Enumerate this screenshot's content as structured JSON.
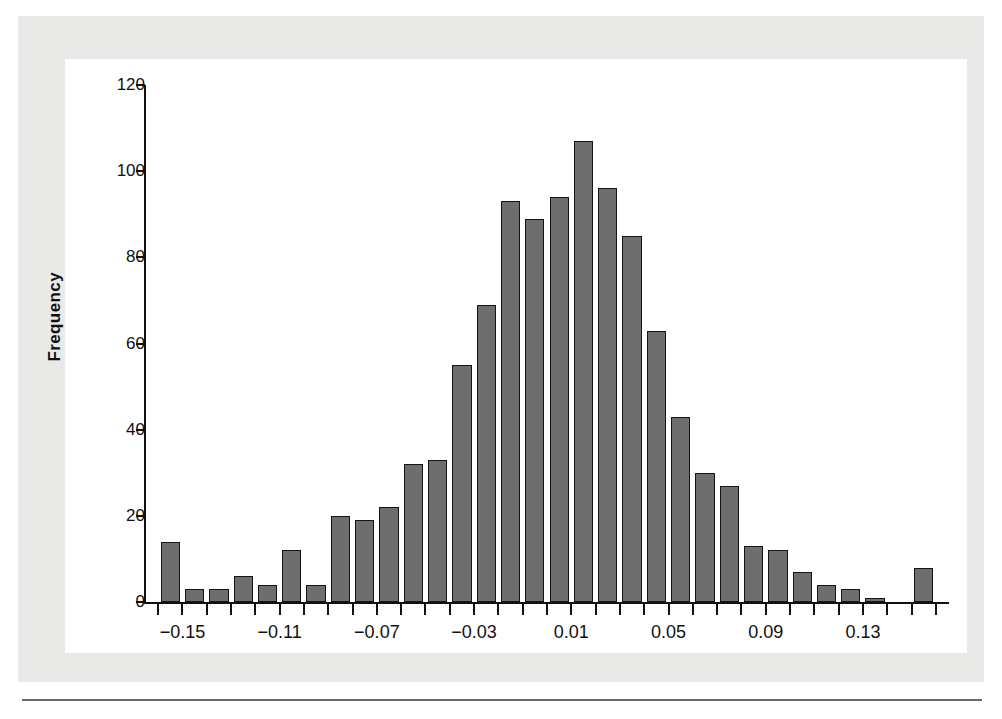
{
  "figure": {
    "background_color": "#e9e9e7",
    "plot_background_color": "#ffffff",
    "bar_fill_color": "#6e6e6e",
    "bar_edge_color": "#141414",
    "axis_color": "#111111"
  },
  "chart_data": {
    "type": "bar",
    "title": "",
    "subtitle": "",
    "xlabel": "",
    "ylabel": "Frequency",
    "ylim": [
      0,
      120
    ],
    "xlim": [
      -0.165,
      0.165
    ],
    "grid": false,
    "legend": null,
    "y_ticks": [
      0,
      20,
      40,
      60,
      80,
      100,
      120
    ],
    "y_tick_labels": [
      "0",
      "20",
      "40",
      "60",
      "80",
      "100",
      "120"
    ],
    "x_ticks": [
      -0.15,
      -0.11,
      -0.07,
      -0.03,
      0.01,
      0.05,
      0.09,
      0.13
    ],
    "x_tick_labels": [
      "−0.15",
      "−0.11",
      "−0.07",
      "−0.03",
      "0.01",
      "0.05",
      "0.09",
      "0.13"
    ],
    "bin_width": 0.01,
    "bin_centers": [
      -0.155,
      -0.145,
      -0.135,
      -0.125,
      -0.115,
      -0.105,
      -0.095,
      -0.085,
      -0.075,
      -0.065,
      -0.055,
      -0.045,
      -0.035,
      -0.025,
      -0.015,
      -0.005,
      0.005,
      0.015,
      0.025,
      0.035,
      0.045,
      0.055,
      0.065,
      0.075,
      0.085,
      0.095,
      0.105,
      0.115,
      0.125,
      0.135,
      0.145,
      0.155
    ],
    "values": [
      14,
      3,
      3,
      6,
      4,
      12,
      4,
      20,
      19,
      22,
      32,
      33,
      55,
      69,
      93,
      89,
      94,
      107,
      96,
      85,
      63,
      43,
      30,
      27,
      13,
      12,
      7,
      4,
      3,
      1,
      0,
      8
    ]
  }
}
